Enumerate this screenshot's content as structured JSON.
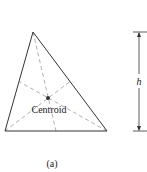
{
  "figure": {
    "caption": "(a)",
    "centroid_label": "Centroid",
    "height_label": "h",
    "colors": {
      "outline": "#333333",
      "median_dash": "#9a9a9a",
      "centroid_dot": "#333333",
      "text": "#222222"
    },
    "geometry": {
      "vertices": [
        [
          33,
          32
        ],
        [
          5,
          131
        ],
        [
          107,
          131
        ]
      ],
      "centroid": [
        48,
        98
      ],
      "height_dimension": {
        "x": 139,
        "y_top": 32,
        "y_bottom": 131
      }
    }
  }
}
